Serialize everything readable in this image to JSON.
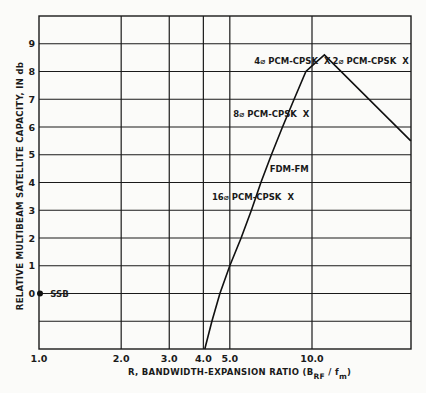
{
  "chart_data": {
    "type": "line",
    "title": "",
    "xlabel": "R, BANDWIDTH-EXPANSION RATIO (B RF / f m)",
    "xlabel_parts": {
      "main": "R, BANDWIDTH-EXPANSION RATIO (B",
      "sub1": "RF",
      "mid": " / f",
      "sub2": "m",
      "end": ")"
    },
    "ylabel": "RELATIVE MULTIBEAM SATELLITE CAPACITY, IN db",
    "xscale": "log",
    "xlim": [
      1.0,
      23
    ],
    "ylim": [
      -2,
      10
    ],
    "grid": true,
    "x_ticks": [
      {
        "value": 1.0,
        "label": "1.0"
      },
      {
        "value": 2.0,
        "label": "2.0"
      },
      {
        "value": 3.0,
        "label": "3.0"
      },
      {
        "value": 4.0,
        "label": "4.0"
      },
      {
        "value": 5.0,
        "label": "5.0"
      },
      {
        "value": 10.0,
        "label": "10.0"
      }
    ],
    "y_ticks": [
      {
        "value": 0,
        "label": "0"
      },
      {
        "value": 1,
        "label": "1"
      },
      {
        "value": 2,
        "label": "2"
      },
      {
        "value": 3,
        "label": "3"
      },
      {
        "value": 4,
        "label": "4"
      },
      {
        "value": 5,
        "label": "5"
      },
      {
        "value": 6,
        "label": "6"
      },
      {
        "value": 7,
        "label": "7"
      },
      {
        "value": 8,
        "label": "8"
      },
      {
        "value": 9,
        "label": "9"
      }
    ],
    "y_gridlines": [
      -1,
      0,
      1,
      2,
      3,
      4,
      5,
      6,
      7,
      8,
      9
    ],
    "series": [
      {
        "name": "FDM-FM",
        "x": [
          4.05,
          4.3,
          4.6,
          5.0,
          5.5,
          6.0,
          6.5,
          7.1,
          7.8,
          8.6,
          9.5,
          10.0,
          11.1,
          23.0
        ],
        "y": [
          -2.0,
          -1.0,
          0.0,
          1.0,
          2.0,
          3.0,
          4.0,
          5.0,
          6.0,
          7.0,
          8.0,
          8.2,
          8.6,
          5.5
        ]
      }
    ],
    "points": [
      {
        "name": "SSB",
        "x": 1.0,
        "y": 0.0,
        "marker": "dot"
      },
      {
        "name": "16⌀ PCM-CPSK",
        "x": 5.8,
        "y": 3.5,
        "marker": "X"
      },
      {
        "name": "8⌀ PCM-CPSK",
        "x": 7.6,
        "y": 6.5,
        "marker": "X"
      },
      {
        "name": "4⌀ PCM-CPSK",
        "x": 9.1,
        "y": 8.4,
        "marker": "X"
      },
      {
        "name": "2⌀ PCM-CPSK",
        "x": 21.5,
        "y": 8.4,
        "marker": "X"
      }
    ],
    "annotations": [
      {
        "text": "SSB",
        "x": 1.1,
        "y": 0.0
      },
      {
        "text": "16⌀ PCM-CPSK  X",
        "x": 4.3,
        "y": 3.5
      },
      {
        "text": "8⌀ PCM-CPSK  X",
        "x": 5.15,
        "y": 6.5
      },
      {
        "text": "4⌀ PCM-CPSK  X",
        "x": 6.15,
        "y": 8.4
      },
      {
        "text": "2⌀ PCM-CPSK  X",
        "x": 11.9,
        "y": 8.4
      },
      {
        "text": "FDM-FM",
        "x": 7.0,
        "y": 4.5
      }
    ],
    "legend": null
  }
}
